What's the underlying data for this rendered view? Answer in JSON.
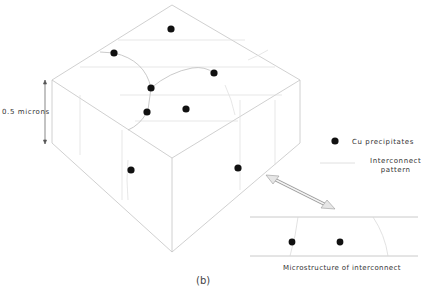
{
  "figure": {
    "panel_label": "(b)",
    "thickness_label": "0.5 microns",
    "caption_inset": "Microstructure of interconnect"
  },
  "legend": {
    "items": [
      {
        "symbol": "filled-dot",
        "label": "Cu precipitates"
      },
      {
        "symbol": "thin-line",
        "label_line1": "Interconnect",
        "label_line2": "pattern"
      }
    ]
  },
  "colors": {
    "dot": "#111111",
    "outline": "#c8c8c8",
    "pattern": "#d8d8d8",
    "arrow": "#aaaaaa",
    "text": "#333333"
  },
  "block_precipitates": [
    {
      "x": 171,
      "y": 29
    },
    {
      "x": 114,
      "y": 53
    },
    {
      "x": 214,
      "y": 73
    },
    {
      "x": 151,
      "y": 88
    },
    {
      "x": 147,
      "y": 112
    },
    {
      "x": 186,
      "y": 109
    },
    {
      "x": 131,
      "y": 170
    },
    {
      "x": 238,
      "y": 168
    }
  ],
  "inset_precipitates": [
    {
      "x": 292,
      "y": 242
    },
    {
      "x": 340,
      "y": 242
    }
  ]
}
